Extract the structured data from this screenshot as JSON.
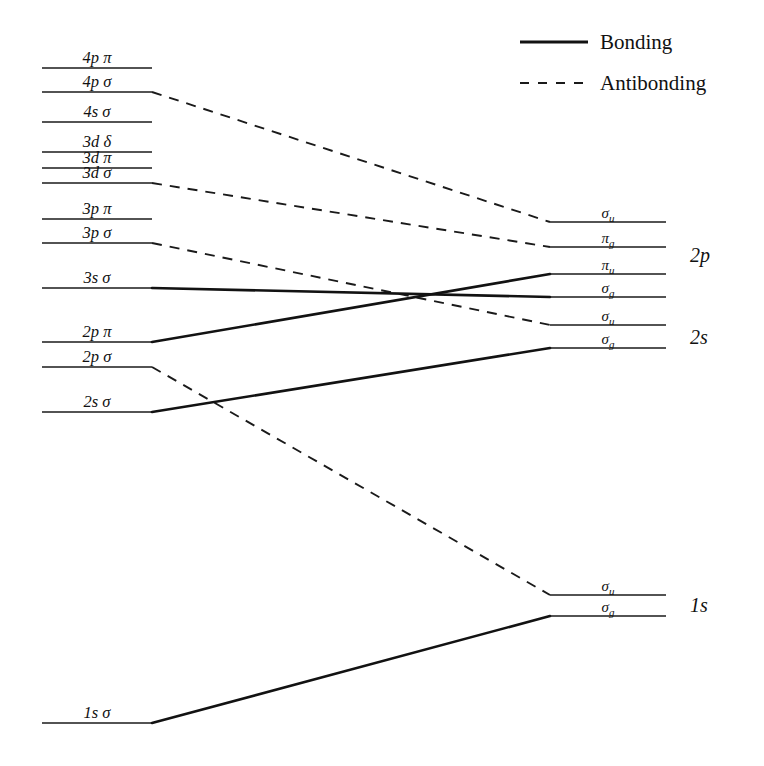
{
  "figure": {
    "background_color": "#ffffff",
    "line_color": "#121212",
    "width": 764,
    "height": 766
  },
  "legend": {
    "position": "top-right",
    "entries": [
      {
        "label": "Bonding",
        "style": "solid"
      },
      {
        "label": "Antibonding",
        "style": "dashed"
      }
    ]
  },
  "left_axis": {
    "description": "United-atom / separated-atom atomic orbital levels",
    "line_x_start": 42,
    "line_x_end": 152,
    "levels": [
      {
        "id": "4p-pi",
        "n": "4",
        "l": "p",
        "sym": "π",
        "label": "4p π",
        "y": 68
      },
      {
        "id": "4p-sig",
        "n": "4",
        "l": "p",
        "sym": "σ",
        "label": "4p σ",
        "y": 92
      },
      {
        "id": "4s-sig",
        "n": "4",
        "l": "s",
        "sym": "σ",
        "label": "4s σ",
        "y": 122
      },
      {
        "id": "3d-del",
        "n": "3",
        "l": "d",
        "sym": "δ",
        "label": "3d δ",
        "y": 152
      },
      {
        "id": "3d-pi",
        "n": "3",
        "l": "d",
        "sym": "π",
        "label": "3d π",
        "y": 168
      },
      {
        "id": "3d-sig",
        "n": "3",
        "l": "d",
        "sym": "σ",
        "label": "3d σ",
        "y": 183
      },
      {
        "id": "3p-pi",
        "n": "3",
        "l": "p",
        "sym": "π",
        "label": "3p π",
        "y": 219
      },
      {
        "id": "3p-sig",
        "n": "3",
        "l": "p",
        "sym": "σ",
        "label": "3p σ",
        "y": 243
      },
      {
        "id": "3s-sig",
        "n": "3",
        "l": "s",
        "sym": "σ",
        "label": "3s σ",
        "y": 288
      },
      {
        "id": "2p-pi",
        "n": "2",
        "l": "p",
        "sym": "π",
        "label": "2p π",
        "y": 342
      },
      {
        "id": "2p-sig",
        "n": "2",
        "l": "p",
        "sym": "σ",
        "label": "2p σ",
        "y": 367
      },
      {
        "id": "2s-sig",
        "n": "2",
        "l": "s",
        "sym": "σ",
        "label": "2s σ",
        "y": 412
      },
      {
        "id": "1s-sig",
        "n": "1",
        "l": "s",
        "sym": "σ",
        "label": "1s σ",
        "y": 723
      }
    ]
  },
  "right_axis": {
    "description": "Diatomic molecular orbital levels grouped by parent shell",
    "line_x_start": 550,
    "line_x_end": 666,
    "levels": [
      {
        "id": "mo-2p-sigma-u",
        "label": "σ",
        "subscript": "u",
        "full": "σu",
        "y": 222,
        "group": "2p"
      },
      {
        "id": "mo-2p-pi-g",
        "label": "π",
        "subscript": "g",
        "full": "πg",
        "y": 247,
        "group": "2p"
      },
      {
        "id": "mo-2p-pi-u",
        "label": "π",
        "subscript": "u",
        "full": "πu",
        "y": 274,
        "group": "2p"
      },
      {
        "id": "mo-2p-sigma-g",
        "label": "σ",
        "subscript": "g",
        "full": "σg",
        "y": 297,
        "group": "2p"
      },
      {
        "id": "mo-2s-sigma-u",
        "label": "σ",
        "subscript": "u",
        "full": "σu",
        "y": 325,
        "group": "2s"
      },
      {
        "id": "mo-2s-sigma-g",
        "label": "σ",
        "subscript": "g",
        "full": "σg",
        "y": 348,
        "group": "2s"
      },
      {
        "id": "mo-1s-sigma-u",
        "label": "σ",
        "subscript": "u",
        "full": "σu",
        "y": 595,
        "group": "1s"
      },
      {
        "id": "mo-1s-sigma-g",
        "label": "σ",
        "subscript": "g",
        "full": "σg",
        "y": 616,
        "group": "1s"
      }
    ],
    "groups": [
      {
        "id": "group-2p",
        "label": "2p",
        "y": 262,
        "x": 690
      },
      {
        "id": "group-2s",
        "label": "2s",
        "y": 344,
        "x": 690
      },
      {
        "id": "group-1s",
        "label": "1s",
        "y": 612,
        "x": 690
      }
    ]
  },
  "correlations": [
    {
      "id": "corr-4p-sigma-to-2p-sigma-u",
      "from": "4p-sig",
      "to": "mo-2p-sigma-u",
      "type": "antibonding"
    },
    {
      "id": "corr-3d-sigma-to-2p-pi-g",
      "from": "3d-sig",
      "to": "mo-2p-pi-g",
      "type": "antibonding"
    },
    {
      "id": "corr-3p-sigma-to-2s-sigma-u",
      "from": "3p-sig",
      "to": "mo-2s-sigma-u",
      "type": "antibonding"
    },
    {
      "id": "corr-2p-sigma-to-1s-sigma-u",
      "from": "2p-sig",
      "to": "mo-1s-sigma-u",
      "type": "antibonding"
    },
    {
      "id": "corr-3s-sigma-to-2p-sigma-g",
      "from": "3s-sig",
      "to": "mo-2p-sigma-g",
      "type": "bonding"
    },
    {
      "id": "corr-2p-pi-to-2p-pi-u",
      "from": "2p-pi",
      "to": "mo-2p-pi-u",
      "type": "bonding"
    },
    {
      "id": "corr-2s-sigma-to-2s-sigma-g",
      "from": "2s-sig",
      "to": "mo-2s-sigma-g",
      "type": "bonding"
    },
    {
      "id": "corr-1s-sigma-to-1s-sigma-g",
      "from": "1s-sig",
      "to": "mo-1s-sigma-g",
      "type": "bonding"
    }
  ]
}
